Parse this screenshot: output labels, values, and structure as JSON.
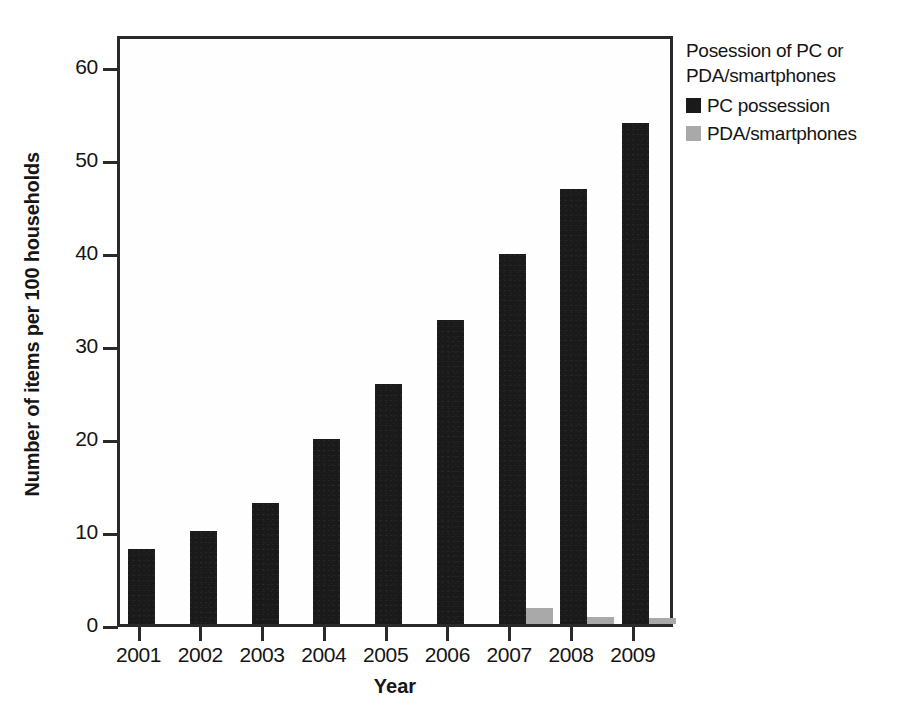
{
  "chart_data": {
    "type": "bar",
    "title": "",
    "xlabel": "Year",
    "ylabel": "Number of items per 100 households",
    "categories": [
      "2001",
      "2002",
      "2003",
      "2004",
      "2005",
      "2006",
      "2007",
      "2008",
      "2009"
    ],
    "series": [
      {
        "name": "PC possession",
        "color": "#1a1a1a",
        "values": [
          8.1,
          10.0,
          13.0,
          19.9,
          25.8,
          32.7,
          39.8,
          46.7,
          53.8
        ]
      },
      {
        "name": "PDA/smartphones",
        "color": "#a9a9a9",
        "values": [
          0,
          0,
          0,
          0,
          0,
          0,
          1.7,
          0.8,
          0.7
        ]
      }
    ],
    "ylim": [
      0,
      63.5
    ],
    "yticks": [
      0,
      10,
      20,
      30,
      40,
      50,
      60
    ],
    "ytick_labels": [
      "0",
      "10",
      "20",
      "30",
      "40",
      "50",
      "60"
    ],
    "grid": false,
    "legend_position": "right"
  },
  "legend": {
    "title_line1": "Posession of PC or",
    "title_line2": "PDA/smartphones",
    "entries": [
      {
        "label": "PC possession",
        "color": "#1a1a1a"
      },
      {
        "label": "PDA/smartphones",
        "color": "#a9a9a9"
      }
    ]
  },
  "caption": {
    "label": "",
    "text": ""
  }
}
